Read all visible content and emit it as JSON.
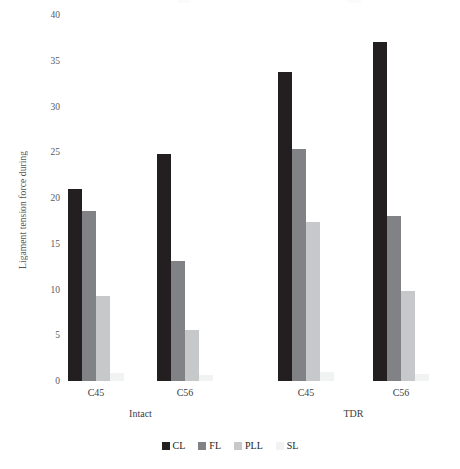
{
  "chart_data": {
    "type": "bar",
    "title": "",
    "xlabel": "",
    "ylabel": "Ligament tension force during",
    "ylim": [
      0,
      40
    ],
    "ytick_labels": [
      "0",
      "5",
      "10",
      "15",
      "20",
      "25",
      "30",
      "35",
      "40"
    ],
    "ytick_values": [
      0,
      5,
      10,
      15,
      20,
      25,
      30,
      35,
      40
    ],
    "grid": false,
    "legend_position": "bottom-center",
    "categories": [
      "C45",
      "C56",
      "C45",
      "C56"
    ],
    "group_labels": [
      "Intact",
      "TDR"
    ],
    "group_spans": [
      [
        "C45",
        "C56"
      ],
      [
        "C45",
        "C56"
      ]
    ],
    "series": [
      {
        "name": "CL",
        "color": "#231f20",
        "values": [
          21.0,
          24.8,
          33.8,
          37.0
        ]
      },
      {
        "name": "FL",
        "color": "#808285",
        "values": [
          18.6,
          13.1,
          25.4,
          18.0
        ]
      },
      {
        "name": "PLL",
        "color": "#c7c8ca",
        "values": [
          9.3,
          5.6,
          17.4,
          9.8
        ]
      },
      {
        "name": "SL",
        "color": "#f1f2f2",
        "values": [
          0.9,
          0.7,
          1.0,
          0.8
        ]
      }
    ]
  },
  "legend": {
    "items": [
      {
        "label": "CL"
      },
      {
        "label": "FL"
      },
      {
        "label": "PLL"
      },
      {
        "label": "SL"
      }
    ]
  }
}
